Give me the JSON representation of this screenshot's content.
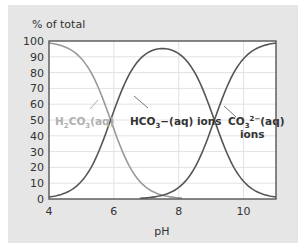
{
  "chart_data": {
    "type": "line",
    "title": "",
    "ylabel": "% of total",
    "xlabel": "pH",
    "xlim": [
      4,
      11
    ],
    "ylim": [
      0,
      100
    ],
    "x_ticks": [
      4,
      6,
      8,
      10
    ],
    "y_ticks": [
      0,
      10,
      20,
      30,
      40,
      50,
      60,
      70,
      80,
      90,
      100
    ],
    "grid": true,
    "legend": "none (inline labels)",
    "pKa1": 5.9,
    "pKa2": 9.1,
    "series": [
      {
        "name": "H2CO3(aq)",
        "label_main": "H",
        "label_parts": [
          "H",
          "2",
          "CO",
          "3",
          "(aq)"
        ],
        "color": "#9a9a9a",
        "x": [
          4,
          4.5,
          5,
          5.5,
          5.9,
          6.5,
          7,
          7.5,
          8
        ],
        "values": [
          98.8,
          96.2,
          88.8,
          71.5,
          50,
          20.1,
          7.4,
          2.5,
          0.8
        ]
      },
      {
        "name": "HCO3-(aq) ions",
        "label_parts": [
          "HCO",
          "3",
          "−(aq) ions"
        ],
        "color": "#555555",
        "x": [
          4,
          5,
          5.9,
          6.5,
          7,
          7.5,
          8,
          8.5,
          9.1,
          10,
          11
        ],
        "values": [
          1.2,
          11.2,
          50,
          79.7,
          91.9,
          95.0,
          91.8,
          79.2,
          50,
          11.2,
          0.8
        ]
      },
      {
        "name": "CO3 2-(aq) ions",
        "label_parts": [
          "CO",
          "3",
          "2−",
          "(aq)",
          "ions"
        ],
        "color": "#555555",
        "x": [
          7,
          7.5,
          8,
          8.5,
          9.1,
          9.5,
          10,
          10.5,
          11
        ],
        "values": [
          0.8,
          2.5,
          7.4,
          20.1,
          50,
          71.5,
          88.8,
          96.2,
          98.8
        ]
      }
    ]
  },
  "axes": {
    "y_title": "% of total",
    "x_title": "pH",
    "x_tick_labels": [
      "4",
      "6",
      "8",
      "10"
    ],
    "y_tick_labels": [
      "0",
      "10",
      "20",
      "30",
      "40",
      "50",
      "60",
      "70",
      "80",
      "90",
      "100"
    ]
  },
  "colors": {
    "panel": "#e6e6e6",
    "plot_bg": "#ffffff",
    "grid": "#e2e2e2",
    "axis": "#555555",
    "h2co3": "#9a9a9a",
    "hco3": "#555555",
    "co3": "#555555",
    "label_h2co3": "#b0b0b0",
    "label_dark": "#333333"
  }
}
